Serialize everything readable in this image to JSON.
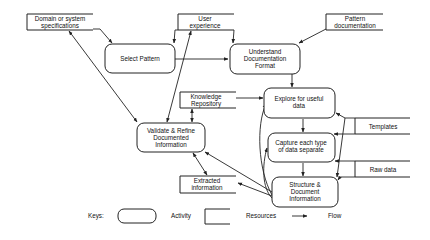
{
  "diagram": {
    "activities": [
      {
        "id": "select",
        "lines": [
          "Select Pattern"
        ]
      },
      {
        "id": "understand",
        "lines": [
          "Understand",
          "Documentation",
          "Format"
        ]
      },
      {
        "id": "explore",
        "lines": [
          "Explore for useful",
          "data"
        ]
      },
      {
        "id": "validate",
        "lines": [
          "Validate & Refine",
          "Documented",
          "Information"
        ]
      },
      {
        "id": "capture",
        "lines": [
          "Capture each type",
          "of data separate"
        ]
      },
      {
        "id": "structure",
        "lines": [
          "Structure &",
          "Document",
          "Information"
        ]
      }
    ],
    "resources": [
      {
        "id": "domain",
        "lines": [
          "Domain or system",
          "specifications"
        ]
      },
      {
        "id": "user",
        "lines": [
          "User",
          "experience"
        ]
      },
      {
        "id": "pattern",
        "lines": [
          "Pattern",
          "documentation"
        ]
      },
      {
        "id": "knowledge",
        "lines": [
          "Knowledge",
          "Repository"
        ]
      },
      {
        "id": "templates",
        "lines": [
          "Templates"
        ]
      },
      {
        "id": "rawdata",
        "lines": [
          "Raw data"
        ]
      },
      {
        "id": "extracted",
        "lines": [
          "Extracted",
          "information"
        ]
      }
    ],
    "legend": {
      "keys_label": "Keys:",
      "activity_label": "Activity",
      "resources_label": "Resources",
      "flow_label": "Flow"
    }
  }
}
